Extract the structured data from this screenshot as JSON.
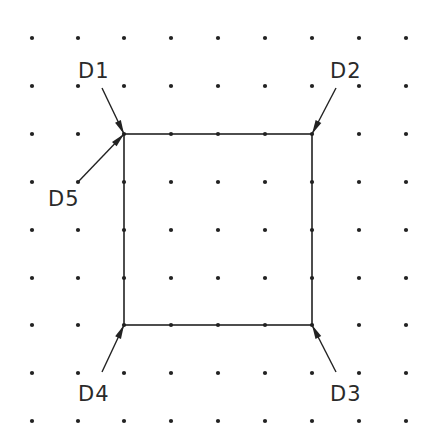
{
  "diagram": {
    "type": "grid-snap-rectangle",
    "grid": {
      "columns_x": [
        32,
        78,
        124,
        171,
        218,
        265,
        312,
        359,
        406
      ],
      "rows_y": [
        38,
        86,
        134,
        182,
        230,
        278,
        325,
        373,
        421
      ],
      "dot_color": "#222222"
    },
    "rectangle": {
      "x1": 124,
      "y1": 134,
      "x2": 312,
      "y2": 325,
      "stroke": "#222222"
    },
    "callouts": [
      {
        "label": "D1",
        "text_x": 78,
        "text_y": 78,
        "from": [
          102,
          88
        ],
        "to": [
          124,
          134
        ]
      },
      {
        "label": "D2",
        "text_x": 330,
        "text_y": 78,
        "from": [
          336,
          88
        ],
        "to": [
          312,
          134
        ]
      },
      {
        "label": "D3",
        "text_x": 330,
        "text_y": 401,
        "from": [
          336,
          372
        ],
        "to": [
          312,
          325
        ]
      },
      {
        "label": "D4",
        "text_x": 78,
        "text_y": 401,
        "from": [
          102,
          372
        ],
        "to": [
          124,
          325
        ]
      },
      {
        "label": "D5",
        "text_x": 48,
        "text_y": 206,
        "from": [
          78,
          182
        ],
        "to": [
          124,
          134
        ]
      }
    ]
  }
}
